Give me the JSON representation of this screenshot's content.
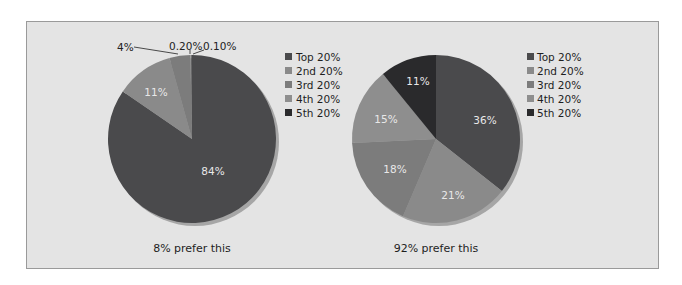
{
  "chart_data": [
    {
      "type": "pie",
      "title": "",
      "caption": "8% prefer this",
      "categories": [
        "Top 20%",
        "2nd 20%",
        "3rd 20%",
        "4th 20%",
        "5th 20%"
      ],
      "values": [
        84,
        11,
        4,
        0.2,
        0.1
      ],
      "labels": [
        "84%",
        "11%",
        "4%",
        "0.20%",
        "0.10%"
      ],
      "colors": [
        "#4a4a4c",
        "#8a8a8a",
        "#7c7c7c",
        "#8e8e8e",
        "#2a2a2c"
      ],
      "start_angle": "12 o'clock, clockwise",
      "legend_position": "right"
    },
    {
      "type": "pie",
      "title": "",
      "caption": "92% prefer this",
      "categories": [
        "Top 20%",
        "2nd 20%",
        "3rd 20%",
        "4th 20%",
        "5th 20%"
      ],
      "values": [
        36,
        21,
        18,
        15,
        11
      ],
      "labels": [
        "36%",
        "21%",
        "18%",
        "15%",
        "11%"
      ],
      "colors": [
        "#4a4a4c",
        "#8a8a8a",
        "#7c7c7c",
        "#8e8e8e",
        "#2a2a2c"
      ],
      "start_angle": "12 o'clock, clockwise",
      "legend_position": "right"
    }
  ],
  "legend": {
    "items": [
      {
        "label": "Top 20%",
        "color": "#4a4a4c"
      },
      {
        "label": "2nd 20%",
        "color": "#8a8a8a"
      },
      {
        "label": "3rd 20%",
        "color": "#7c7c7c"
      },
      {
        "label": "4th 20%",
        "color": "#8e8e8e"
      },
      {
        "label": "5th 20%",
        "color": "#2a2a2c"
      }
    ]
  },
  "colors": {
    "panel_background": "#e4e4e4",
    "panel_border": "#9a9a9a",
    "pie_shadow": "#a6a6a6",
    "slice_label_text": "#e8e8e8",
    "caption_text": "#1e1e1e"
  }
}
